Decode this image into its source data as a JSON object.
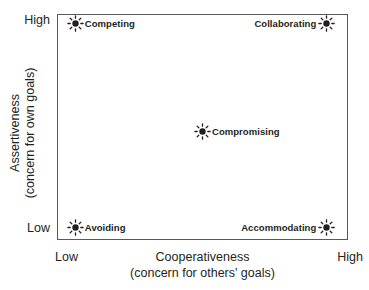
{
  "chart_data": {
    "type": "scatter",
    "title": "",
    "xlabel": "Cooperativeness",
    "xlabel_sub": "(concern for others' goals)",
    "ylabel": "Assertiveness",
    "ylabel_sub": "(concern for own goals)",
    "xticks": [
      "Low",
      "High"
    ],
    "yticks": [
      "Low",
      "High"
    ],
    "xlim": [
      0,
      1
    ],
    "ylim": [
      0,
      1
    ],
    "grid": false,
    "legend": "none",
    "marker": "starburst-icon",
    "marker_color": "#231f20",
    "frame_color": "#58595b",
    "points": [
      {
        "label": "Competing",
        "x": 0.06,
        "y": 0.96,
        "label_side": "right"
      },
      {
        "label": "Collaborating",
        "x": 0.93,
        "y": 0.96,
        "label_side": "left"
      },
      {
        "label": "Compromising",
        "x": 0.5,
        "y": 0.48,
        "label_side": "right"
      },
      {
        "label": "Avoiding",
        "x": 0.06,
        "y": 0.05,
        "label_side": "right"
      },
      {
        "label": "Accommodating",
        "x": 0.93,
        "y": 0.05,
        "label_side": "left"
      }
    ]
  },
  "axes": {
    "y": {
      "title_line1": "Assertiveness",
      "title_line2": "(concern for own goals)",
      "tick_high": "High",
      "tick_low": "Low"
    },
    "x": {
      "title_line1": "Cooperativeness",
      "title_line2": "(concern for others' goals)",
      "tick_high": "High",
      "tick_low": "Low"
    }
  },
  "points": {
    "competing": {
      "label": "Competing"
    },
    "collaborating": {
      "label": "Collaborating"
    },
    "compromising": {
      "label": "Compromising"
    },
    "avoiding": {
      "label": "Avoiding"
    },
    "accommodating": {
      "label": "Accommodating"
    }
  }
}
